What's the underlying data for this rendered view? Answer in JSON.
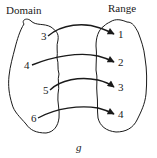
{
  "diagram": {
    "type": "function-mapping",
    "function_name": "g",
    "domain": {
      "title": "Domain",
      "elements": [
        "3",
        "4",
        "5",
        "6"
      ]
    },
    "range": {
      "title": "Range",
      "elements": [
        "1",
        "2",
        "3",
        "4"
      ]
    },
    "mappings": [
      {
        "from": "3",
        "to": "1"
      },
      {
        "from": "4",
        "to": "2"
      },
      {
        "from": "5",
        "to": "3"
      },
      {
        "from": "6",
        "to": "4"
      }
    ],
    "colors": {
      "stroke": "#1a1a1a",
      "background": "#ffffff"
    }
  }
}
